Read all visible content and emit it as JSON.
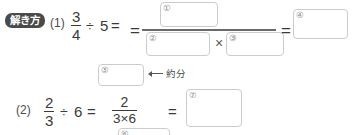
{
  "page": {
    "section_badge": "解き方",
    "background_color": "#ffffff",
    "text_color": "#3a3a3a",
    "box_border_color": "#c8ccd0",
    "badge_color": "#4a4a4a"
  },
  "problems": [
    {
      "number": "(1)",
      "expression": {
        "dividend": {
          "numerator": "3",
          "denominator": "4"
        },
        "divide_sign": "÷",
        "divisor": "5",
        "equals": "=",
        "result_numerator_box": "①",
        "result_denominator_left_box": "②",
        "times_sign": "×",
        "result_denominator_right_box": "③",
        "equals2": "=",
        "final_box": "④"
      }
    },
    {
      "number": "(2)",
      "expression": {
        "dividend": {
          "numerator": "2",
          "denominator": "3"
        },
        "divide_sign": "÷",
        "divisor": "6",
        "equals": "=",
        "middle_fraction": {
          "numerator": "2",
          "denominator": "3×6"
        },
        "equals2": "=",
        "final_box": "⑦",
        "reduced_numerator_box": "⑤",
        "reduced_denominator_box": "⑥"
      },
      "annotation": {
        "label": "約分",
        "arrow": "left-arrow-icon"
      }
    }
  ],
  "answer_boxes": [
    {
      "marker": "①",
      "value": ""
    },
    {
      "marker": "②",
      "value": ""
    },
    {
      "marker": "③",
      "value": ""
    },
    {
      "marker": "④",
      "value": ""
    },
    {
      "marker": "⑤",
      "value": ""
    },
    {
      "marker": "⑥",
      "value": ""
    },
    {
      "marker": "⑦",
      "value": ""
    }
  ]
}
